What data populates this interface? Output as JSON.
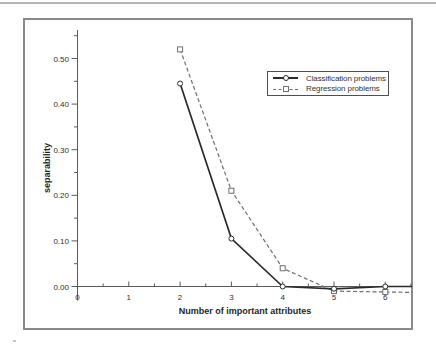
{
  "chart_data": {
    "type": "line",
    "title": "",
    "xlabel": "Number of important attributes",
    "ylabel": "separability",
    "xlim": [
      0,
      6.52
    ],
    "ylim": [
      -0.03,
      0.56
    ],
    "grid": false,
    "legend_position": "upper right inside",
    "x_ticks": {
      "values": [
        0,
        1,
        2,
        3,
        4,
        5,
        6
      ],
      "labels": [
        "0",
        "1",
        "2",
        "3",
        "4",
        "5",
        "6"
      ],
      "minor_values": [
        0.5,
        1.5,
        2.5,
        3.5,
        4.5,
        5.5,
        6.5
      ]
    },
    "y_ticks": {
      "values": [
        0,
        0.1,
        0.2,
        0.3,
        0.4,
        0.5
      ],
      "labels": [
        "0.00",
        "0.10",
        "0.20",
        "0.30",
        "0.40",
        "0.50"
      ],
      "minor_values": [
        0.05,
        0.15,
        0.25,
        0.35,
        0.45,
        0.55
      ]
    },
    "x": [
      2,
      3,
      4,
      5,
      6
    ],
    "series": [
      {
        "name": "Classification problems",
        "values": [
          0.445,
          0.105,
          0.0,
          -0.005,
          0.0
        ],
        "line_style": "solid",
        "marker": "circle",
        "color": "#2a2a2a",
        "tail_y": 0.0
      },
      {
        "name": "Regression problems",
        "values": [
          0.52,
          0.21,
          0.04,
          -0.01,
          -0.012
        ],
        "line_style": "dashed",
        "marker": "square",
        "color": "#6f6f6f",
        "tail_y": -0.013
      }
    ],
    "colors": {
      "axis": "#5a5a5a",
      "tick_text": "#2e2e2e",
      "frame_border": "#8a8a8a",
      "top_rule": "#b5b5b5"
    }
  }
}
